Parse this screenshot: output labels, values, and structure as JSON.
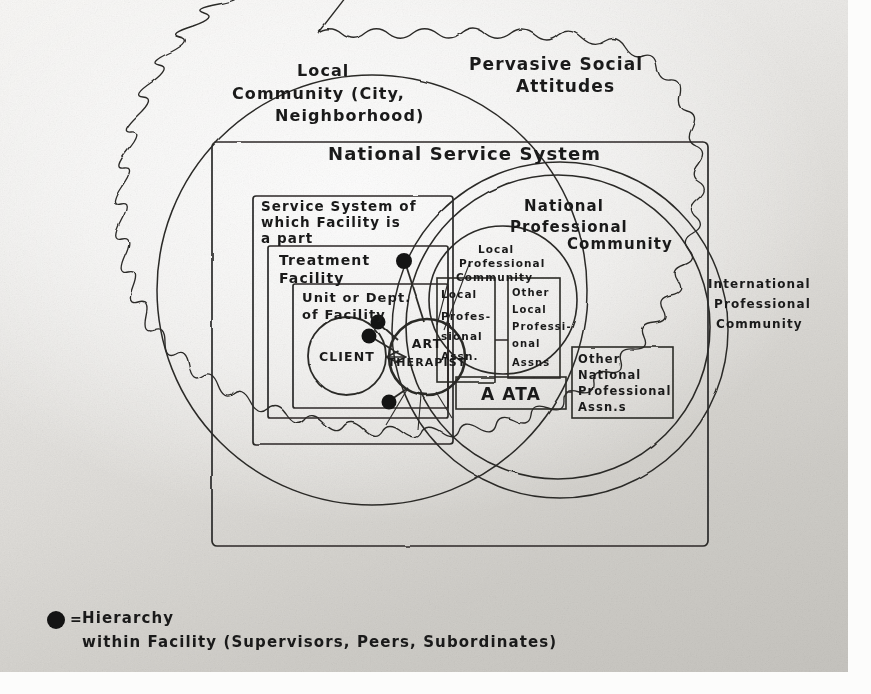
{
  "diagram": {
    "type": "nested-systems-venn",
    "medium": "hand-drawn pencil/ink on paper, photocopied"
  },
  "regions": {
    "pervasive_social_attitudes": {
      "label_line1": "Pervasive Social",
      "label_line2": "Attitudes",
      "shape": "scalloped-cloud-outline",
      "role": "outermost boundary"
    },
    "local_community": {
      "label_line1": "Local",
      "label_line2": "Community (City,",
      "label_line3": "Neighborhood)",
      "shape": "large-circle"
    },
    "national_service_system": {
      "label": "National   Service   System",
      "shape": "rectangle"
    },
    "service_system_of_which_facility": {
      "label_line1": "Service System of",
      "label_line2": "which Facility   is",
      "label_line3": "a part",
      "shape": "rectangle"
    },
    "treatment_facility": {
      "label_line1": "Treatment",
      "label_line2": "Facility",
      "shape": "rectangle"
    },
    "unit_or_dept": {
      "label_line1": "Unit or Dept.",
      "label_line2": "of Facility",
      "shape": "rectangle"
    },
    "client": {
      "label": "CLIENT",
      "shape": "circle"
    },
    "art_therapist": {
      "label_line1": "ART",
      "label_line2": "THERAPIST",
      "shape": "circle",
      "role": "central focus"
    },
    "national_professional_community": {
      "label_line1": "National",
      "label_line2": "Professional",
      "label_line3": "Community",
      "shape": "large-circle"
    },
    "international_professional_community": {
      "label_line1": "International",
      "label_line2": "Professional",
      "label_line3": "Community",
      "shape": "large-circle-outer-ring"
    },
    "local_professional_community": {
      "label_line1": "Local",
      "label_line2": "Professional",
      "label_line3": "Community",
      "shape": "circle"
    },
    "local_professional_assn": {
      "label_line1": "Local",
      "label_line2": "Profes-",
      "label_line3": "sional",
      "label_line4": "Assn.",
      "shape": "rectangle"
    },
    "other_local_professional_assns": {
      "label_line1": "Other",
      "label_line2": "Local",
      "label_line3": "Professi-",
      "label_line4": "onal",
      "label_line5": "Assns",
      "shape": "rectangle"
    },
    "aata": {
      "label": "A ATA",
      "shape": "rectangle"
    },
    "other_national_professional_assns": {
      "label_line1": "Other",
      "label_line2": "National",
      "label_line3": "Professional",
      "label_line4": "Assn.s",
      "shape": "rectangle"
    }
  },
  "connections": {
    "client_therapist": {
      "style": "double-headed-arrow"
    },
    "hierarchy_dots": {
      "count": 4,
      "style": "filled-circle-on-stem"
    }
  },
  "legend": {
    "symbol": "filled-dot",
    "equals": "=",
    "line1": "Hierarchy",
    "line2": "within  Facility (Supervisors, Peers, Subordinates)"
  },
  "colors": {
    "ink": "#2b2a28",
    "dot": "#141414",
    "paper_light": "#f7f6f4",
    "paper_dark": "#c6c4bf"
  }
}
